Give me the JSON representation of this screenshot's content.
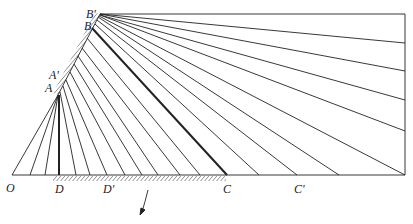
{
  "figure": {
    "labels": {
      "O": "O",
      "D": "D",
      "D_prime": "D'",
      "C": "C",
      "C_prime": "C'",
      "A": "A",
      "A_prime": "A'",
      "B": "B",
      "B_prime": "B'"
    },
    "colors": {
      "line": "#222222",
      "background": "#ffffff"
    },
    "points": {
      "O": [
        12,
        175
      ],
      "D": [
        59,
        175
      ],
      "C": [
        227,
        175
      ],
      "C_prime": [
        297,
        175
      ],
      "A": [
        58,
        95
      ],
      "B": [
        92,
        28
      ],
      "B_prime": [
        100,
        14
      ],
      "top_right": [
        405,
        14
      ],
      "bottom_right": [
        405,
        175
      ]
    }
  }
}
